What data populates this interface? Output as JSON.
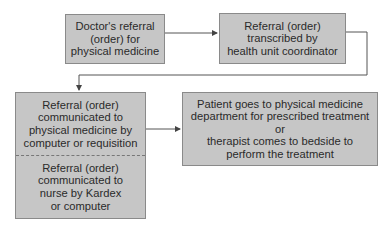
{
  "diagram": {
    "nodes": [
      {
        "id": "doctor-referral",
        "lines": [
          "Doctor's referral",
          "(order) for",
          "physical medicine"
        ]
      },
      {
        "id": "transcribed",
        "lines": [
          "Referral (order)",
          "transcribed by",
          "health unit coordinator"
        ]
      },
      {
        "id": "communicated",
        "sections": [
          {
            "lines": [
              "Referral (order)",
              "communicated to",
              "physical medicine by",
              "computer or requisition"
            ]
          },
          {
            "lines": [
              "Referral (order)",
              "communicated to",
              "nurse by Kardex",
              "or computer"
            ]
          }
        ]
      },
      {
        "id": "treatment",
        "lines": [
          "Patient goes to physical medicine",
          "department for prescribed treatment",
          "or",
          "therapist comes to bedside to",
          "perform the treatment"
        ]
      }
    ],
    "edges": [
      {
        "from": "doctor-referral",
        "to": "transcribed"
      },
      {
        "from": "transcribed",
        "to": "communicated"
      },
      {
        "from": "communicated",
        "to": "treatment"
      }
    ],
    "colors": {
      "box_fill": "#c6c6c6",
      "box_border": "#8a8a8a",
      "line": "#555555",
      "text": "#2a2a2a"
    }
  }
}
